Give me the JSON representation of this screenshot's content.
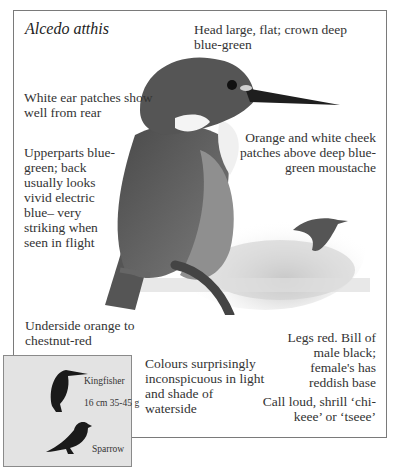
{
  "species": {
    "scientific_name": "Alcedo atthis"
  },
  "annotations": {
    "head": "Head large, flat; crown deep blue-green",
    "ear": "White ear patches show well from rear",
    "upperparts": "Upperparts blue-green; back usually looks vivid electric blue– very striking when seen in flight",
    "cheek": "Orange and white cheek patches above deep blue-green moustache",
    "underside": "Underside orange to chestnut-red",
    "colours": "Colours surprisingly inconspicuous in light and shade of waterside",
    "legs": "Legs red. Bill of male black; female's has reddish base",
    "call": "Call loud, shrill ‘chi-keee’ or ‘tseee’"
  },
  "size_comparison": {
    "bird1_label": "Kingfisher",
    "bird1_size": "16 cm  35-45 g",
    "bird2_label": "Sparrow"
  },
  "colors": {
    "frame": "#7a7a7a",
    "inset_bg": "#e3e3e3",
    "text": "#333333"
  }
}
